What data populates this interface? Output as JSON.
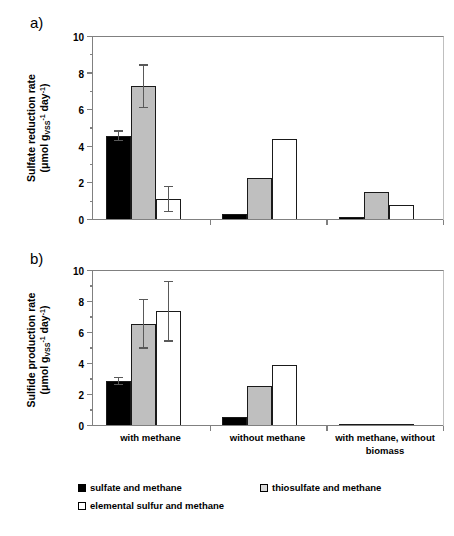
{
  "figure": {
    "panel_a_label": "a)",
    "panel_b_label": "b)"
  },
  "categories": [
    "with methane",
    "without methane",
    "with methane, without biomass"
  ],
  "category_lines": {
    "c0_l1": "with methane",
    "c1_l1": "without methane",
    "c2_l1": "with methane, without",
    "c2_l2": "biomass"
  },
  "legend": {
    "position": "bottom",
    "items": [
      {
        "label": "sulfate and methane",
        "swatch": "black",
        "color": "#000000"
      },
      {
        "label": "thiosulfate and methane",
        "swatch": "gray",
        "color": "#bfbfbf"
      },
      {
        "label": "elemental sulfur and methane",
        "swatch": "white",
        "color": "#ffffff"
      }
    ]
  },
  "axis": {
    "ticks": [
      "0",
      "2",
      "4",
      "6",
      "8",
      "10"
    ],
    "ylim_min": 0,
    "ylim_max": 10
  },
  "chart_data": [
    {
      "type": "bar",
      "panel": "a",
      "title": "",
      "xlabel": "",
      "ylabel": "Sulfate reduction rate (μmol g_VSS⁻¹ day⁻¹)",
      "ylabel_line1": "Sulfate reduction rate",
      "ylim": [
        0,
        10
      ],
      "yticks": [
        0,
        2,
        4,
        6,
        8,
        10
      ],
      "grid": false,
      "categories": [
        "with methane",
        "without methane",
        "with methane, without biomass"
      ],
      "series": [
        {
          "name": "sulfate and methane",
          "color": "#000000",
          "values": [
            4.6,
            0.35,
            0.15
          ],
          "errors": [
            0.3,
            0,
            0
          ]
        },
        {
          "name": "thiosulfate and methane",
          "color": "#bfbfbf",
          "values": [
            7.3,
            2.3,
            1.55
          ],
          "errors": [
            1.2,
            0,
            0
          ]
        },
        {
          "name": "elemental sulfur and methane",
          "color": "#ffffff",
          "values": [
            1.15,
            4.4,
            0.8
          ],
          "errors": [
            0.7,
            0,
            0
          ]
        }
      ]
    },
    {
      "type": "bar",
      "panel": "b",
      "title": "",
      "xlabel": "",
      "ylabel": "Sulfide production rate (μmol g_VSS⁻¹ day⁻¹)",
      "ylabel_line1": "Sulfide production rate",
      "ylim": [
        0,
        10
      ],
      "yticks": [
        0,
        2,
        4,
        6,
        8,
        10
      ],
      "grid": false,
      "categories": [
        "with methane",
        "without methane",
        "with methane, without biomass"
      ],
      "series": [
        {
          "name": "sulfate and methane",
          "color": "#000000",
          "values": [
            2.9,
            0.6,
            0.05
          ],
          "errors": [
            0.25,
            0,
            0
          ]
        },
        {
          "name": "thiosulfate and methane",
          "color": "#bfbfbf",
          "values": [
            6.6,
            2.55,
            0.1
          ],
          "errors": [
            1.6,
            0,
            0
          ]
        },
        {
          "name": "elemental sulfur and methane",
          "color": "#ffffff",
          "values": [
            7.4,
            3.95,
            0.1
          ],
          "errors": [
            1.95,
            0,
            0
          ]
        }
      ]
    }
  ]
}
